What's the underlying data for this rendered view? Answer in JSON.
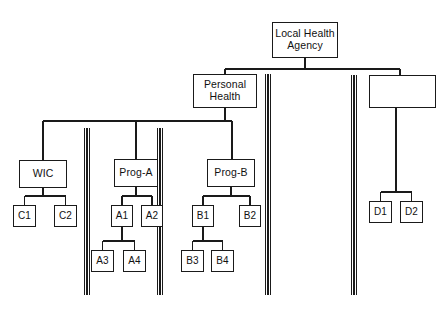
{
  "diagram": {
    "type": "organizational-hierarchy-tree",
    "background_color": "#ffffff",
    "line_color": "#1a1a1a",
    "text_color": "#111111",
    "nodes": [
      {
        "id": "lha",
        "label": "Local Health\nAgency",
        "level": 1,
        "x": 272,
        "y": 22,
        "w": 66,
        "h": 36,
        "style": "lvl1"
      },
      {
        "id": "ph",
        "label": "Personal\nHealth",
        "level": 2,
        "x": 193,
        "y": 74,
        "w": 64,
        "h": 34,
        "style": "lvl2"
      },
      {
        "id": "blank",
        "label": "",
        "level": 2,
        "x": 369,
        "y": 75,
        "w": 67,
        "h": 33,
        "style": "empty"
      },
      {
        "id": "wic",
        "label": "WIC",
        "level": 3,
        "x": 19,
        "y": 160,
        "w": 48,
        "h": 28,
        "style": "lvl3"
      },
      {
        "id": "proga",
        "label": "Prog-A",
        "level": 3,
        "x": 114,
        "y": 159,
        "w": 44,
        "h": 28,
        "style": "lvl3"
      },
      {
        "id": "progb",
        "label": "Prog-B",
        "level": 3,
        "x": 207,
        "y": 159,
        "w": 48,
        "h": 28,
        "style": "lvl3"
      },
      {
        "id": "c1",
        "label": "C1",
        "level": 4,
        "x": 13,
        "y": 205,
        "w": 23,
        "h": 22,
        "style": "leaf"
      },
      {
        "id": "c2",
        "label": "C2",
        "level": 4,
        "x": 54,
        "y": 205,
        "w": 23,
        "h": 22,
        "style": "leaf"
      },
      {
        "id": "a1",
        "label": "A1",
        "level": 4,
        "x": 111,
        "y": 205,
        "w": 22,
        "h": 22,
        "style": "leaf"
      },
      {
        "id": "a2",
        "label": "A2",
        "level": 4,
        "x": 141,
        "y": 205,
        "w": 22,
        "h": 22,
        "style": "leaf"
      },
      {
        "id": "b1",
        "label": "B1",
        "level": 4,
        "x": 192,
        "y": 205,
        "w": 22,
        "h": 22,
        "style": "leaf"
      },
      {
        "id": "b2",
        "label": "B2",
        "level": 4,
        "x": 239,
        "y": 205,
        "w": 22,
        "h": 22,
        "style": "leaf"
      },
      {
        "id": "d1",
        "label": "D1",
        "level": 4,
        "x": 369,
        "y": 201,
        "w": 23,
        "h": 22,
        "style": "leaf"
      },
      {
        "id": "d2",
        "label": "D2",
        "level": 4,
        "x": 400,
        "y": 201,
        "w": 23,
        "h": 22,
        "style": "leaf"
      },
      {
        "id": "a3",
        "label": "A3",
        "level": 5,
        "x": 91,
        "y": 250,
        "w": 23,
        "h": 22,
        "style": "leaf"
      },
      {
        "id": "a4",
        "label": "A4",
        "level": 5,
        "x": 123,
        "y": 250,
        "w": 23,
        "h": 22,
        "style": "leaf"
      },
      {
        "id": "b3",
        "label": "B3",
        "level": 5,
        "x": 181,
        "y": 250,
        "w": 23,
        "h": 22,
        "style": "leaf"
      },
      {
        "id": "b4",
        "label": "B4",
        "level": 5,
        "x": 211,
        "y": 250,
        "w": 23,
        "h": 22,
        "style": "leaf"
      }
    ],
    "edges": [
      {
        "from": "lha",
        "to": "ph"
      },
      {
        "from": "lha",
        "to": "blank"
      },
      {
        "from": "ph",
        "to": "wic"
      },
      {
        "from": "ph",
        "to": "proga"
      },
      {
        "from": "ph",
        "to": "progb"
      },
      {
        "from": "wic",
        "to": "c1"
      },
      {
        "from": "wic",
        "to": "c2"
      },
      {
        "from": "proga",
        "to": "a1"
      },
      {
        "from": "proga",
        "to": "a2"
      },
      {
        "from": "progb",
        "to": "b1"
      },
      {
        "from": "progb",
        "to": "b2"
      },
      {
        "from": "blank",
        "to": "d1"
      },
      {
        "from": "blank",
        "to": "d2"
      },
      {
        "from": "a1",
        "to": "a3"
      },
      {
        "from": "a1",
        "to": "a4"
      },
      {
        "from": "b1",
        "to": "b3"
      },
      {
        "from": "b1",
        "to": "b4"
      }
    ],
    "dividers": [
      {
        "id": "divider-1",
        "x": 87,
        "y1": 128,
        "y2": 295
      },
      {
        "id": "divider-2",
        "x": 160,
        "y1": 128,
        "y2": 295
      },
      {
        "id": "divider-3",
        "x": 268,
        "y1": 74,
        "y2": 295
      },
      {
        "id": "divider-4",
        "x": 354,
        "y1": 75,
        "y2": 295
      }
    ]
  },
  "chart_data": {
    "type": "table",
    "hierarchy": [
      {
        "label": "Local Health Agency",
        "children": [
          {
            "label": "Personal Health",
            "children": [
              {
                "label": "WIC",
                "children": [
                  {
                    "label": "C1"
                  },
                  {
                    "label": "C2"
                  }
                ]
              },
              {
                "label": "Prog-A",
                "children": [
                  {
                    "label": "A1",
                    "children": [
                      {
                        "label": "A3"
                      },
                      {
                        "label": "A4"
                      }
                    ]
                  },
                  {
                    "label": "A2"
                  }
                ]
              },
              {
                "label": "Prog-B",
                "children": [
                  {
                    "label": "B1",
                    "children": [
                      {
                        "label": "B3"
                      },
                      {
                        "label": "B4"
                      }
                    ]
                  },
                  {
                    "label": "B2"
                  }
                ]
              }
            ]
          },
          {
            "label": "",
            "children": [
              {
                "label": "D1"
              },
              {
                "label": "D2"
              }
            ]
          }
        ]
      }
    ]
  }
}
